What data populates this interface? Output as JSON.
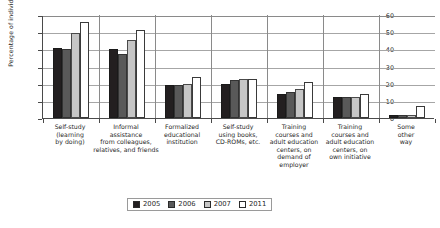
{
  "chart_data": {
    "type": "bar",
    "title": "",
    "subtitle": "",
    "xlabel": "",
    "ylabel": "Percentage of individuals (%)",
    "ylim": [
      0,
      60
    ],
    "ytick_values": [
      0,
      10,
      20,
      30,
      40,
      50,
      60
    ],
    "ytick_labels": [
      "0",
      "10",
      "20",
      "30",
      "40",
      "50",
      "60"
    ],
    "grid": true,
    "legend_position": "bottom",
    "categories": [
      "Self-study\n(learning\nby doing)",
      "Informal\nassistance\nfrom colleagues,\nrelatives, and friends",
      "Formalized\neducational\ninstitution",
      "Self-study\nusing books,\nCD-ROMs, etc.",
      "Training\ncourses and\nadult education\ncenters, on\ndemand of\nemployer",
      "Training\ncourses and\nadult education\ncenters, on\nown initiative",
      "Some\nother\nway"
    ],
    "series": [
      {
        "name": "2005",
        "color": "#231f20",
        "values": [
          41,
          40,
          19,
          20,
          14,
          12,
          2
        ]
      },
      {
        "name": "2006",
        "color": "#595959",
        "values": [
          40,
          37,
          19,
          22,
          15,
          12,
          2
        ]
      },
      {
        "name": "2007",
        "color": "#c6c6c6",
        "values": [
          49.5,
          45.5,
          20,
          23,
          17,
          12,
          2
        ]
      },
      {
        "name": "2011",
        "color": "#ffffff",
        "values": [
          56,
          51,
          24,
          23,
          21,
          14,
          7
        ]
      }
    ]
  },
  "legend": {
    "items": [
      {
        "label": "2005"
      },
      {
        "label": "2006"
      },
      {
        "label": "2007"
      },
      {
        "label": "2011"
      }
    ]
  }
}
